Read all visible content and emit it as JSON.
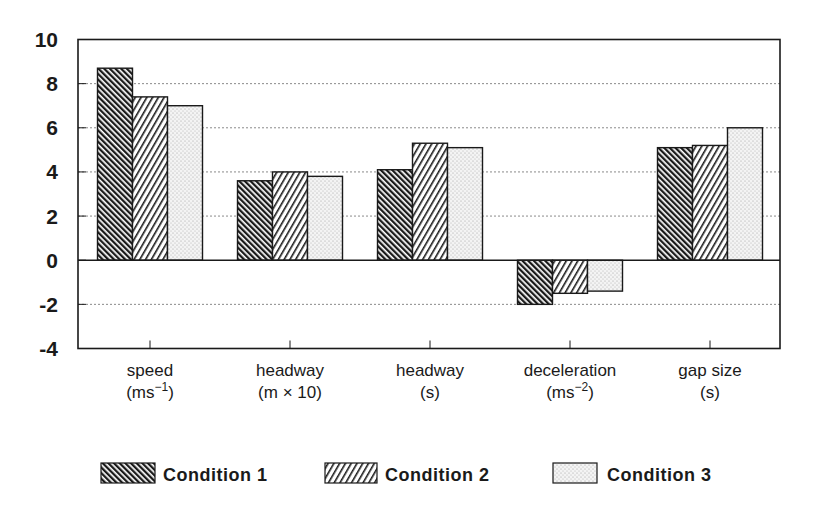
{
  "chart_data": {
    "type": "bar",
    "title": "",
    "xlabel": "",
    "ylabel": "",
    "ylim": [
      -4,
      10
    ],
    "yticks": [
      10,
      8,
      6,
      4,
      2,
      0,
      -2,
      -4
    ],
    "grid": true,
    "grid_style": "dotted horizontal",
    "legend_position": "bottom",
    "categories": [
      {
        "line1": "speed",
        "line2": "(ms",
        "sup": "−1",
        "line2_end": ")"
      },
      {
        "line1": "headway",
        "line2": "(m × 10)",
        "sup": "",
        "line2_end": ""
      },
      {
        "line1": "headway",
        "line2": "(s)",
        "sup": "",
        "line2_end": ""
      },
      {
        "line1": "deceleration",
        "line2": "(ms",
        "sup": "−2",
        "line2_end": ")"
      },
      {
        "line1": "gap size",
        "line2": "(s)",
        "sup": "",
        "line2_end": ""
      }
    ],
    "category_names": [
      "speed (ms-1)",
      "headway (m x 10)",
      "headway (s)",
      "deceleration (ms-2)",
      "gap size (s)"
    ],
    "series": [
      {
        "name": "Condition 1",
        "pattern": "dense-backslash-hatch",
        "values": [
          8.7,
          3.6,
          4.1,
          -2.0,
          5.1
        ]
      },
      {
        "name": "Condition 2",
        "pattern": "forward-slash-hatch",
        "values": [
          7.4,
          4.0,
          5.3,
          -1.5,
          5.2
        ]
      },
      {
        "name": "Condition 3",
        "pattern": "light-stipple",
        "values": [
          7.0,
          3.8,
          5.1,
          -1.4,
          6.0
        ]
      }
    ]
  },
  "legend": {
    "items": [
      {
        "label": "Condition 1"
      },
      {
        "label": "Condition 2"
      },
      {
        "label": "Condition 3"
      }
    ]
  },
  "colors": {
    "ink": "#1a1a1a",
    "grid": "#8a8a8a",
    "background": "#ffffff",
    "stipple_bg": "#f2f2f2"
  }
}
